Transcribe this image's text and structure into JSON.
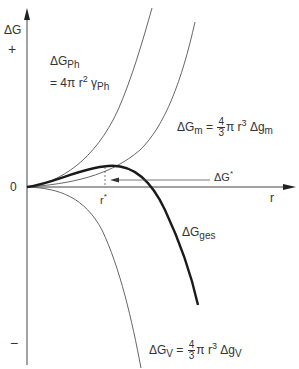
{
  "axes": {
    "y_label": "ΔG",
    "y_plus": "+",
    "y_zero": "0",
    "y_minus": "−",
    "x_label": "r"
  },
  "curves": {
    "surface": {
      "name": "ΔG",
      "sub": "Ph",
      "eq_prefix": "= 4π r",
      "eq_exp": "2",
      "eq_gamma": " γ",
      "eq_gamma_sub": "Ph"
    },
    "matrix": {
      "name": "ΔG",
      "sub": "m",
      "eq": " = ",
      "frac_num": "4",
      "frac_den": "3",
      "eq_mid": "π r",
      "eq_exp": "3",
      "eq_tail": " Δg",
      "eq_tail_sub": "m"
    },
    "total": {
      "name": "ΔG",
      "sub": "ges"
    },
    "volume": {
      "name": "ΔG",
      "sub": "V",
      "eq": " = ",
      "frac_num": "4",
      "frac_den": "3",
      "eq_mid": "π r",
      "eq_exp": "3",
      "eq_tail": " Δg",
      "eq_tail_sub": "V"
    }
  },
  "critical": {
    "radius_label": "r",
    "radius_star": "*",
    "energy_label": "ΔG",
    "energy_star": "*"
  }
}
